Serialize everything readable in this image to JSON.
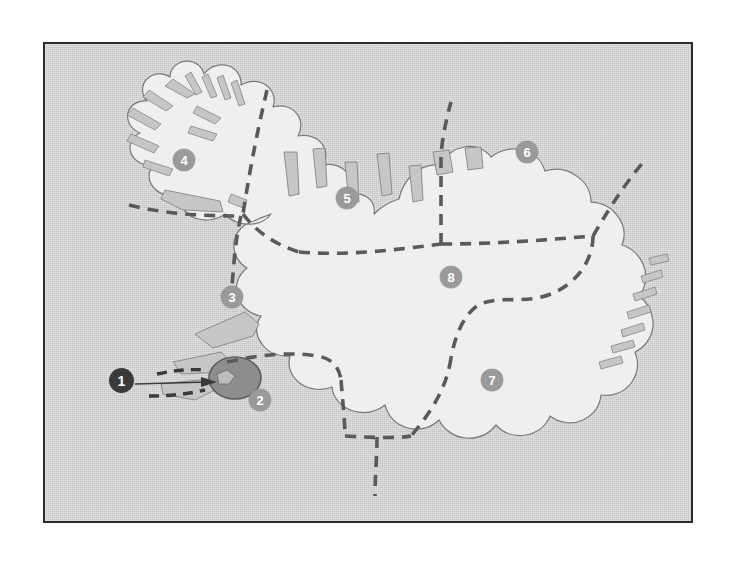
{
  "figure": {
    "frame": {
      "border_color": "#2b2b2b",
      "x": 43,
      "y": 42,
      "width": 650,
      "height": 481
    },
    "colors": {
      "page_background": "#ffffff",
      "ocean": "#c6c6c6",
      "land": "#eeeeee",
      "coastline": "#6e6e6e",
      "region_boundary": "#5a5a5a",
      "region_marker_fill": "#9a9a9a",
      "callout_marker_fill": "#3a3a3a",
      "marker_label": "#ffffff",
      "capital_area_fill": "#8d8d8d",
      "leader_line": "#3a3a3a"
    }
  },
  "markers": [
    {
      "id": "marker-1",
      "label": "1",
      "kind": "callout",
      "x": 120,
      "y": 379,
      "note": "points to capital region"
    },
    {
      "id": "marker-2",
      "label": "2",
      "kind": "region",
      "x": 258,
      "y": 398
    },
    {
      "id": "marker-3",
      "label": "3",
      "kind": "region",
      "x": 230,
      "y": 295
    },
    {
      "id": "marker-4",
      "label": "4",
      "kind": "region",
      "x": 182,
      "y": 158
    },
    {
      "id": "marker-5",
      "label": "5",
      "kind": "region",
      "x": 345,
      "y": 196
    },
    {
      "id": "marker-6",
      "label": "6",
      "kind": "region",
      "x": 525,
      "y": 150
    },
    {
      "id": "marker-7",
      "label": "7",
      "kind": "region",
      "x": 490,
      "y": 378
    },
    {
      "id": "marker-8",
      "label": "8",
      "kind": "region",
      "x": 449,
      "y": 275
    }
  ],
  "callout": {
    "from_marker": "1",
    "target_name": "capital-area",
    "leader_line_count": 2
  },
  "legend": {
    "present": false
  }
}
